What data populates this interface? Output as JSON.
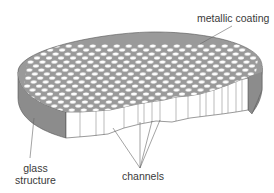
{
  "diagram": {
    "labels": {
      "metallic_coating": "metallic coating",
      "glass_line1": "glass",
      "glass_line2": "structure",
      "channels": "channels"
    },
    "colors": {
      "coating": "#9a9a9a",
      "side": "#8c8c8c",
      "holes": "#ffffff",
      "cut_face": "#ffffff",
      "lines": "#555555",
      "text": "#3a3a3a"
    }
  }
}
